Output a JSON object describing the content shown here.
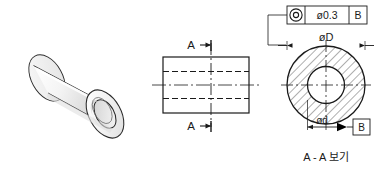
{
  "drawing": {
    "title": "Bushing / hollow cylinder engineering drawing",
    "background_color": "#ffffff",
    "line_color": "#1a1a1a",
    "hatch_color": "#1a1a1a",
    "views": [
      {
        "id": "isometric",
        "name": "isometric-pictorial-view",
        "label": ""
      },
      {
        "id": "front",
        "name": "front-orthographic-view",
        "label": ""
      },
      {
        "id": "section",
        "name": "section-view-a-a",
        "label": "A - A 보기"
      }
    ]
  },
  "section_labels": {
    "top_letter": "A",
    "bottom_letter": "A",
    "view_caption": "A - A 보기"
  },
  "feature_control_frame": {
    "symbol_name": "concentricity-symbol",
    "tolerance_value": "ø0.3",
    "datum_reference": "B"
  },
  "datum": {
    "label": "B"
  },
  "dimensions": [
    {
      "id": "outer",
      "name": "outer-diameter-dimension",
      "label": "øD"
    },
    {
      "id": "inner",
      "name": "inner-diameter-dimension",
      "label": "ød"
    }
  ],
  "colors": {
    "line": "#1a1a1a",
    "hidden_line": "#1a1a1a",
    "center_line": "#1a1a1a",
    "hatch": "#1a1a1a",
    "solid_fill": "#000000",
    "iso_light": "#ffffff",
    "iso_mid": "#e8e8e8",
    "iso_dark": "#c9c9c9",
    "iso_bore_shadow": "#d6d6d6"
  }
}
